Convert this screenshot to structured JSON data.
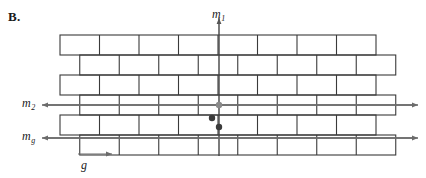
{
  "figure": {
    "panel_label": "B.",
    "background_color": "#ffffff",
    "brick_stroke_color": "#3a3a3a",
    "axis_color": "#444444",
    "arrow_color": "#6b6b6b",
    "dot_dark_color": "#3b3b3b",
    "dot_gray_color": "#8a8a8a"
  },
  "labels": {
    "m1": {
      "base": "m",
      "sub": "1"
    },
    "m2": {
      "base": "m",
      "sub": "2"
    },
    "mg": {
      "base": "m",
      "sub": "g"
    },
    "g": {
      "base": "g",
      "sub": ""
    }
  },
  "wall": {
    "rows": 6,
    "left": 60,
    "top": 35,
    "row_height": 20,
    "brick_width": 39.5,
    "bricks_per_row": 8,
    "bond": "running-bond-half-offset",
    "offset_rows": [
      2,
      4,
      6
    ]
  },
  "axes": {
    "vertical": {
      "x": 219,
      "y_top": 18,
      "y_bottom": 156,
      "arrow": "up",
      "label": "m1"
    },
    "horizontal_upper": {
      "y": 105,
      "x_left": 42,
      "x_right": 418,
      "arrows": "both",
      "label": "m2"
    },
    "horizontal_lower": {
      "y": 138,
      "x_left": 42,
      "x_right": 418,
      "arrows": "both",
      "label": "mg"
    },
    "glide": {
      "y": 154,
      "x_left": 78,
      "x_right": 112,
      "arrow": "right",
      "label": "g"
    }
  },
  "rotation_points": [
    {
      "name": "two-fold-center-gray",
      "x": 219,
      "y": 105,
      "color": "#8a8a8a",
      "radius": 3.2
    },
    {
      "name": "two-fold-offset-dark",
      "x": 212,
      "y": 118,
      "color": "#3b3b3b",
      "radius": 3.2
    },
    {
      "name": "two-fold-axis-dark",
      "x": 219,
      "y": 127,
      "color": "#3b3b3b",
      "radius": 3.2
    }
  ]
}
